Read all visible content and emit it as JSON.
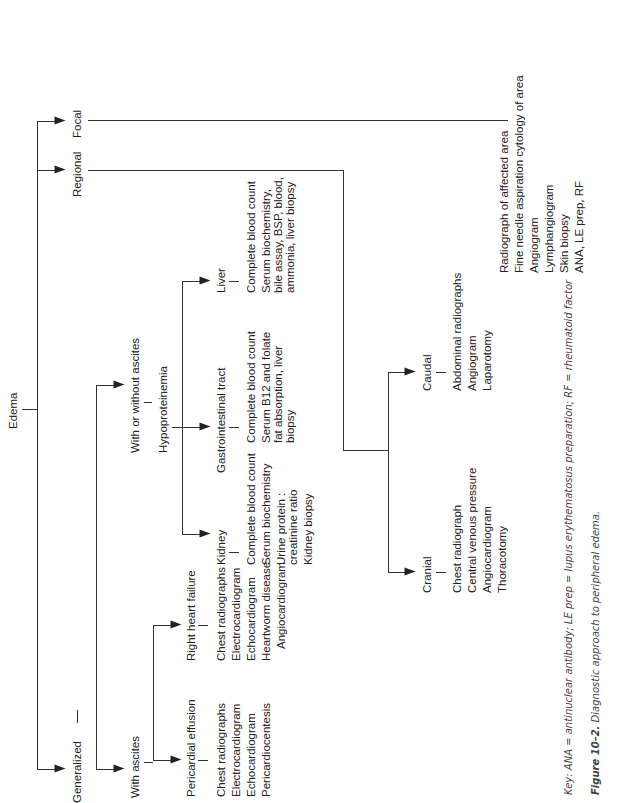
{
  "root": "Edema",
  "level1": {
    "focal": "Focal",
    "regional": "Regional",
    "generalized": "Generalized"
  },
  "focal_tests": [
    "Radiograph of affected area",
    "Fine needle aspiration cytology of area",
    "Angiogram",
    "Lymphangiogram",
    "Skin biopsy",
    "ANA, LE prep, RF"
  ],
  "regional": {
    "cranial": {
      "label": "Cranial",
      "tests": [
        "Chest radiograph",
        "Central venous pressure",
        "Angiocardiogram",
        "Thoracotomy"
      ]
    },
    "caudal": {
      "label": "Caudal",
      "tests": [
        "Abdominal radiographs",
        "Angiogram",
        "Laparotomy"
      ]
    }
  },
  "generalized": {
    "with_ascites": {
      "label": "With ascites",
      "pericardial": {
        "label": "Pericardial effusion",
        "tests": [
          "Chest radiographs",
          "Electrocardiogram",
          "Echocardiogram",
          "Pericardiocentesis"
        ]
      },
      "rhf": {
        "label": "Right heart failure",
        "tests": [
          "Chest radiographs",
          "Electrocardiogram",
          "Echocardiogram",
          "Heartworm disease",
          "Angiocardiogram"
        ]
      }
    },
    "with_without": {
      "label": "With or without ascites",
      "hypo": "Hypoproteinemia",
      "kidney": {
        "label": "Kidney",
        "tests": [
          "Complete blood count",
          "Serum biochemistry",
          "Urine protein :",
          "creatinine ratio",
          "Kidney biopsy"
        ]
      },
      "gi": {
        "label": "Gastrointestinal tract",
        "tests": [
          "Complete blood count",
          "Serum B12 and folate",
          "fat absorption, liver",
          "biopsy"
        ]
      },
      "liver": {
        "label": "Liver",
        "tests": [
          "Complete blood count",
          "Serum biochemistry,",
          "bile assay, BSP, blood,",
          "ammonia, liver biopsy"
        ]
      }
    }
  },
  "caption": {
    "key": "Key: ANA = antinuclear antibody; LE prep = lupus erythematosus preparation; RF = rheumatoid factor",
    "figure_label": "Figure 10–2.",
    "figure_title": "Diagnostic approach to peripheral edema."
  }
}
